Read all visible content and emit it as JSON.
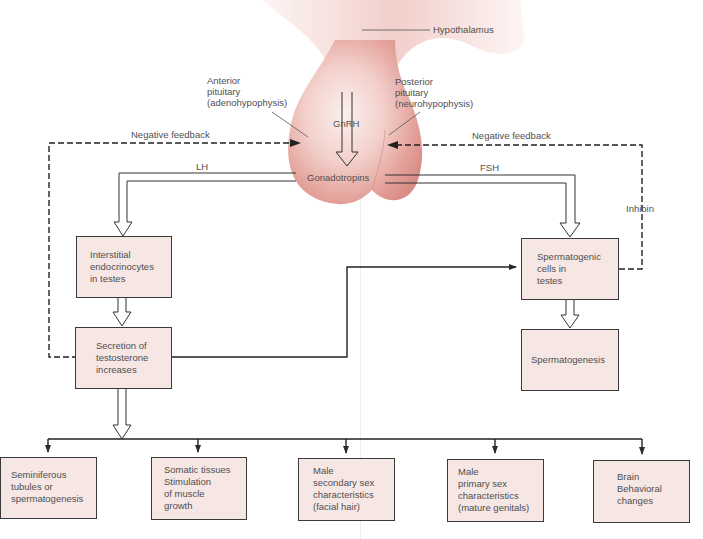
{
  "colors": {
    "gland_light": "#f7e2df",
    "gland_mid": "#e9b1ab",
    "gland_dark": "#d88c86",
    "box_fill": "#f6e7e5",
    "box_shadow": "#f0d3d0",
    "box_border": "#3a3a3a",
    "line": "#2a2a2a",
    "text": "#4e4e4e"
  },
  "labels": {
    "hypothalamus": "Hypothalamus",
    "anterior_pituitary": "Anterior\npituitary\n(adenohypophysis)",
    "posterior_pituitary": "Posterior\npituitary\n(neurohypophysis)",
    "gnrh": "GnRH",
    "gonadotropins": "Gonadotropins",
    "lh": "LH",
    "fsh": "FSH",
    "negative_feedback_left": "Negative feedback",
    "negative_feedback_right": "Negative feedback",
    "inhibin": "Inhibin"
  },
  "boxes": {
    "interstitial": "Interstitial\nendocrinocytes\nin testes",
    "testosterone": "Secretion of\ntestosterone\nincreases",
    "spermatogenic": "Spermatogenic\ncells in\ntestes",
    "spermatogenesis": "Spermatogenesis"
  },
  "targets": [
    {
      "id": "seminiferous",
      "text": "Seminiferous\ntubules or\nspermatogenesis"
    },
    {
      "id": "somatic",
      "text": "Somatic tissues\nStimulation\nof muscle\ngrowth"
    },
    {
      "id": "secondary",
      "text": "Male\nsecondary sex\ncharacteristics\n(facial hair)"
    },
    {
      "id": "primary",
      "text": "Male\nprimary sex\ncharacteristics\n(mature genitals)"
    },
    {
      "id": "brain",
      "text": "Brain\nBehavioral\nchanges"
    }
  ]
}
